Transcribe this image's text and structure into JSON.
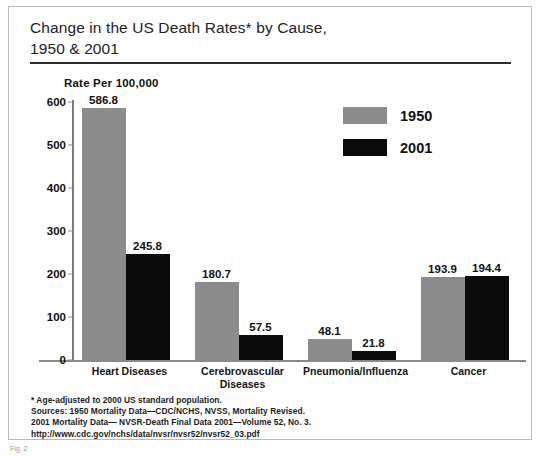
{
  "figure": {
    "title_line1": "Change in the US Death Rates* by Cause,",
    "title_line2": "1950 & 2001",
    "axis_title": "Rate Per 100,000",
    "caption": "Fig. 2"
  },
  "legend": {
    "items": [
      {
        "label": "1950",
        "color": "#8c8c8c"
      },
      {
        "label": "2001",
        "color": "#0b0b0b"
      }
    ]
  },
  "footnotes": [
    "* Age-adjusted to 2000 US standard population.",
    "Sources: 1950 Mortality Data—CDC/NCHS, NVSS, Mortality Revised.",
    "2001 Mortality Data— NVSR-Death Final Data 2001—Volume 52, No. 3.",
    "http://www.cdc.gov/nchs/data/nvsr/nvsr52/nvsr52_03.pdf"
  ],
  "chart_data": {
    "type": "bar",
    "title": "Change in the US Death Rates* by Cause, 1950 & 2001",
    "xlabel": "",
    "ylabel": "Rate Per 100,000",
    "ylim": [
      0,
      600
    ],
    "yticks": [
      0,
      100,
      200,
      300,
      400,
      500,
      600
    ],
    "ytick_labels": [
      "0",
      "100",
      "200",
      "300",
      "400",
      "500",
      "600"
    ],
    "grid": false,
    "legend_position": "upper-right-inside",
    "categories": [
      "Heart Diseases",
      "Cerebrovascular Diseases",
      "Pneumonia/Influenza",
      "Cancer"
    ],
    "category_label_lines": [
      [
        "Heart Diseases"
      ],
      [
        "Cerebrovascular",
        "Diseases"
      ],
      [
        "Pneumonia/Influenza"
      ],
      [
        "Cancer"
      ]
    ],
    "series": [
      {
        "name": "1950",
        "color": "#8c8c8c",
        "values": [
          586.8,
          180.7,
          48.1,
          193.9
        ],
        "value_labels": [
          "586.8",
          "180.7",
          "48.1",
          "193.9"
        ]
      },
      {
        "name": "2001",
        "color": "#0b0b0b",
        "values": [
          245.8,
          57.5,
          21.8,
          194.4
        ],
        "value_labels": [
          "245.8",
          "57.5",
          "21.8",
          "194.4"
        ]
      }
    ]
  }
}
